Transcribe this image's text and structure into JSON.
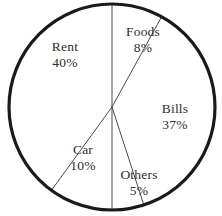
{
  "chart_data": {
    "type": "pie",
    "title": "",
    "subtitle": "",
    "xlabel": "",
    "ylabel": "",
    "legend": "none",
    "grid": false,
    "units": "percent",
    "total": 100,
    "start_angle_deg": 0,
    "direction": "clockwise",
    "categories": [
      "Foods",
      "Bills",
      "Others",
      "Car",
      "Rent"
    ],
    "values": [
      8,
      37,
      5,
      10,
      40
    ],
    "slices": [
      {
        "label": "Foods",
        "value": 8,
        "value_text": "8%",
        "angle_deg": 28.8,
        "start_deg": 0,
        "end_deg": 28.8,
        "label_x": 143,
        "label_y": 40
      },
      {
        "label": "Bills",
        "value": 37,
        "value_text": "37%",
        "angle_deg": 133.2,
        "start_deg": 28.8,
        "end_deg": 162,
        "label_x": 175,
        "label_y": 117
      },
      {
        "label": "Others",
        "value": 5,
        "value_text": "5%",
        "angle_deg": 18,
        "start_deg": 162,
        "end_deg": 180,
        "label_x": 139,
        "label_y": 183
      },
      {
        "label": "Car",
        "value": 10,
        "value_text": "10%",
        "angle_deg": 36,
        "start_deg": 180,
        "end_deg": 216,
        "label_x": 83,
        "label_y": 158
      },
      {
        "label": "Rent",
        "value": 40,
        "value_text": "40%",
        "angle_deg": 144,
        "start_deg": 216,
        "end_deg": 360,
        "label_x": 65,
        "label_y": 55
      }
    ],
    "geometry": {
      "center_x": 112,
      "center_y": 107,
      "radius": 103
    },
    "colors": {
      "slice_fill": "#ffffff",
      "outline": "#1a1a1a",
      "divider": "#4a4a4a",
      "text": "#2e2e2e",
      "background": "#fefefe"
    }
  }
}
